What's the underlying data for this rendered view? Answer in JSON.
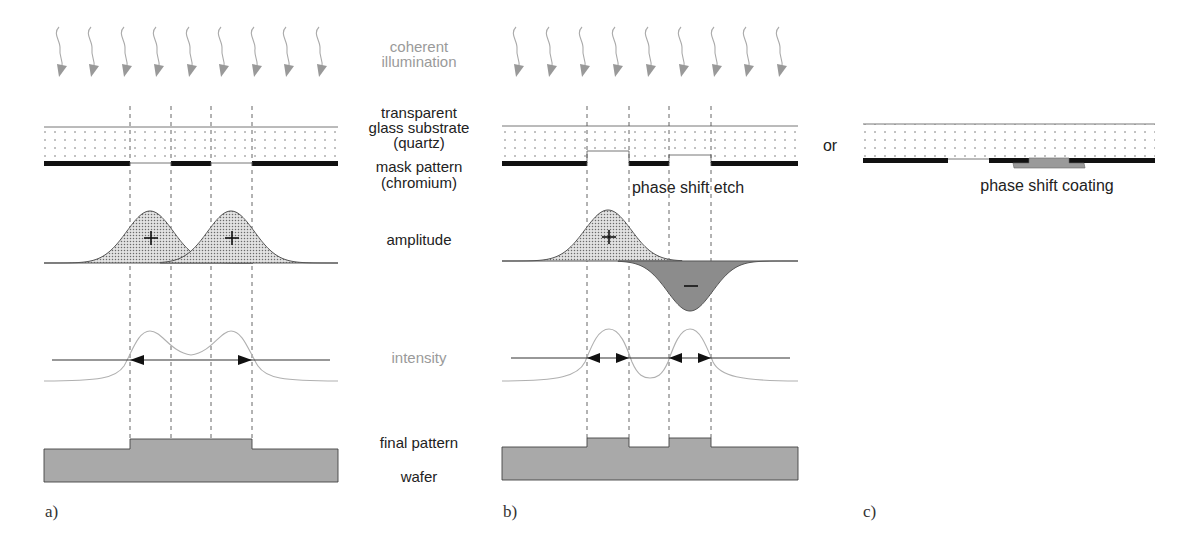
{
  "labels": {
    "coherent_illumination": [
      "coherent",
      "illumination"
    ],
    "glass_substrate": [
      "transparent",
      "glass substrate",
      "(quartz)"
    ],
    "mask_pattern": [
      "mask pattern",
      "(chromium)"
    ],
    "amplitude": "amplitude",
    "intensity": "intensity",
    "final_pattern": "final pattern",
    "wafer": "wafer",
    "phase_shift_etch": "phase shift etch",
    "or": "or",
    "phase_shift_coating": "phase shift coating"
  },
  "panels": [
    {
      "id": "a",
      "tag": "a)",
      "title": "binary mask"
    },
    {
      "id": "b",
      "tag": "b)",
      "title": "phase shift etch mask"
    },
    {
      "id": "c",
      "tag": "c)",
      "title": "phase shift coating mask"
    }
  ],
  "amplitude_signs": {
    "panel_a": [
      "+",
      "+"
    ],
    "panel_b": [
      "+",
      "−"
    ]
  },
  "colors": {
    "text_dark": "#222222",
    "text_light": "#9a9a9a",
    "chrome": "#111111",
    "wafer": "#a9a9a9",
    "negative_amplitude": "#8c8c8c",
    "phase_shift_coating": "#9a9a9a"
  }
}
